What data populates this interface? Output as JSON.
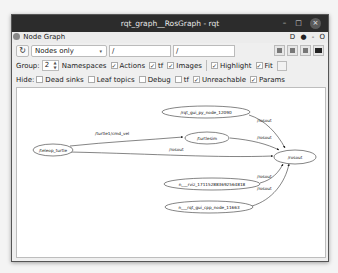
{
  "window": {
    "title": "rqt_graph__RosGraph - rqt",
    "controls": {
      "minimize": "–",
      "maximize": "□",
      "close": "×"
    }
  },
  "dock": {
    "title": "Node Graph",
    "right_controls": {
      "help": "D",
      "settings": "●",
      "minimize": "-",
      "close": "O"
    }
  },
  "toolbar": {
    "refresh_icon": "↻",
    "mode_select": {
      "selected": "Nodes only",
      "arrow": "▾"
    },
    "filter_inputs": [
      {
        "value": "/"
      },
      {
        "value": "/"
      }
    ],
    "action_buttons": [
      {
        "name": "load-dot-icon"
      },
      {
        "name": "save-dot-icon"
      },
      {
        "name": "save-svg-icon"
      },
      {
        "name": "save-image-icon"
      }
    ]
  },
  "options": {
    "group_label": "Group:",
    "group_value": "2",
    "checkboxes": [
      {
        "label": "Namespaces",
        "checked": false,
        "hide_box": true
      },
      {
        "label": "Actions",
        "checked": true
      },
      {
        "label": "tf",
        "checked": true
      },
      {
        "label": "Images",
        "checked": true
      },
      {
        "label": "Highlight",
        "checked": true
      },
      {
        "label": "Fit",
        "checked": true
      }
    ]
  },
  "hide": {
    "label": "Hide:",
    "checkboxes": [
      {
        "label": "Dead sinks",
        "checked": false
      },
      {
        "label": "Leaf topics",
        "checked": false
      },
      {
        "label": "Debug",
        "checked": false
      },
      {
        "label": "tf",
        "checked": false
      },
      {
        "label": "Unreachable",
        "checked": true
      },
      {
        "label": "Params",
        "checked": true
      }
    ]
  },
  "graph": {
    "nodes": [
      {
        "id": "teleop",
        "label": "/teleop_turtle"
      },
      {
        "id": "turtlesim",
        "label": "/turtlesim"
      },
      {
        "id": "rqtpy",
        "label": "/rqt_gui_py_node_12090"
      },
      {
        "id": "rosout",
        "label": "/rosout"
      },
      {
        "id": "rviz",
        "label": "n___rviz_171152883692564818"
      },
      {
        "id": "rqtcpp",
        "label": "n___rqt_gui_cpp_node_11663"
      }
    ],
    "edges": [
      {
        "from": "teleop",
        "to": "turtlesim",
        "label": "/turtle1/cmd_vel"
      },
      {
        "from": "teleop",
        "to": "rosout",
        "label": "/rosout"
      },
      {
        "from": "turtlesim",
        "to": "rosout",
        "label": "/rosout"
      },
      {
        "from": "rqtpy",
        "to": "rosout",
        "label": "/rosout"
      },
      {
        "from": "rviz",
        "to": "rosout",
        "label": "/rosout"
      },
      {
        "from": "rqtcpp",
        "to": "rosout",
        "label": "/rosout"
      }
    ]
  }
}
